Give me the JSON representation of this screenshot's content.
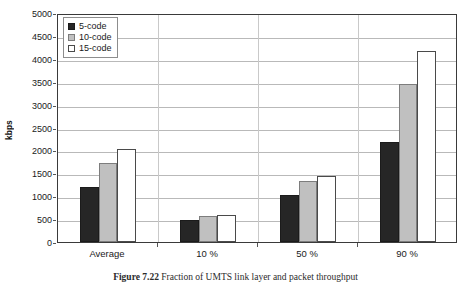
{
  "chart_data": {
    "type": "bar",
    "title": "",
    "xlabel": "",
    "ylabel": "kbps",
    "ylim": [
      0,
      5000
    ],
    "ytick_step": 500,
    "yticks": [
      0,
      500,
      1000,
      1500,
      2000,
      2500,
      3000,
      3500,
      4000,
      4500,
      5000
    ],
    "ytick_labels": [
      "0",
      "500",
      "1000",
      "1500",
      "2000",
      "2500",
      "3000",
      "3500",
      "4000",
      "4500",
      "5000"
    ],
    "categories": [
      "Average",
      "10 %",
      "50 %",
      "90 %"
    ],
    "grid": true,
    "legend_position": "top-left",
    "series": [
      {
        "name": "5-code",
        "color": "#262626",
        "values": [
          1200,
          490,
          1020,
          2190
        ]
      },
      {
        "name": "10-code",
        "color": "#c0c0c0",
        "values": [
          1730,
          570,
          1340,
          3460
        ]
      },
      {
        "name": "15-code",
        "color": "#ffffff",
        "values": [
          2020,
          590,
          1440,
          4180
        ]
      }
    ]
  },
  "legend": {
    "items": [
      {
        "label": "5-code"
      },
      {
        "label": "10-code"
      },
      {
        "label": "15-code"
      }
    ]
  },
  "caption": {
    "figure_number": "Figure  7.22",
    "text": "Fraction of UMTS link layer and packet throughput"
  }
}
